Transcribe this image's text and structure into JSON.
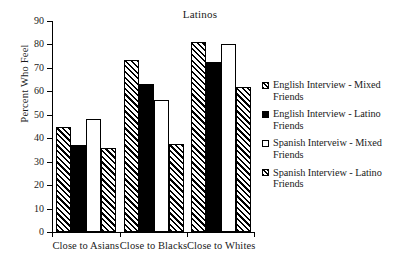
{
  "chart_data": {
    "type": "bar",
    "title": "Latinos",
    "xlabel": "",
    "ylabel": "Percent Who Feel",
    "ylim": [
      0,
      90
    ],
    "ytick_step": 10,
    "yticks": [
      90,
      80,
      70,
      60,
      50,
      40,
      30,
      20,
      10,
      0
    ],
    "grid": false,
    "legend_position": "right",
    "categories": [
      "Close to Asians",
      "Close to Blacks",
      "Close to Whites"
    ],
    "series": [
      {
        "name": "English Interview - Mixed Friends",
        "swatch": "hatch-diagonal",
        "values": [
          45,
          73.5,
          81
        ]
      },
      {
        "name": "English Interview - Latino Friends",
        "swatch": "solid-black",
        "values": [
          37,
          63,
          72.5
        ]
      },
      {
        "name": "Spanish Interveiw - Mixed Friends",
        "swatch": "open-white",
        "values": [
          48,
          56.5,
          80
        ]
      },
      {
        "name": "Spanish Interview - Latino Friends",
        "swatch": "hatch-diagonal",
        "values": [
          36,
          37.5,
          62
        ]
      }
    ]
  }
}
